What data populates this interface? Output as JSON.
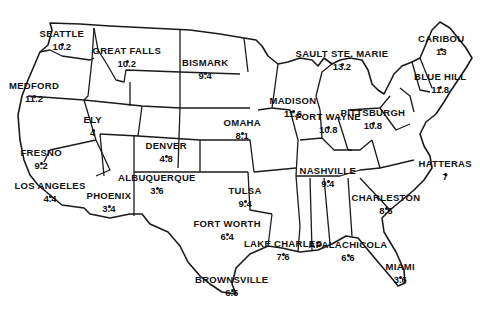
{
  "map": {
    "region": "United States (contiguous)",
    "style": "black outline state map on white",
    "colors": {
      "background": "#ffffff",
      "ink": "#111111"
    },
    "cities": [
      {
        "name": "SEATTLE",
        "value": "10.2",
        "x": 62,
        "y": 33
      },
      {
        "name": "GREAT FALLS",
        "value": "10.2",
        "x": 127,
        "y": 50
      },
      {
        "name": "BISMARK",
        "value": "9.4",
        "x": 205,
        "y": 62
      },
      {
        "name": "SAULT STE. MARIE",
        "value": "13.2",
        "x": 342,
        "y": 53
      },
      {
        "name": "CARIBOU",
        "value": "13",
        "x": 441,
        "y": 38
      },
      {
        "name": "BLUE HILL",
        "value": "11.8",
        "x": 440,
        "y": 76
      },
      {
        "name": "MEDFORD",
        "value": "11.2",
        "x": 34,
        "y": 85
      },
      {
        "name": "MADISON",
        "value": "11.6",
        "x": 293,
        "y": 100
      },
      {
        "name": "FORT WAYNE",
        "value": "10.8",
        "x": 328,
        "y": 116
      },
      {
        "name": "PITTSBURGH",
        "value": "10.8",
        "x": 373,
        "y": 112
      },
      {
        "name": "ELY",
        "value": "4",
        "x": 93,
        "y": 119
      },
      {
        "name": "OMAHA",
        "value": "8.1",
        "x": 242,
        "y": 122
      },
      {
        "name": "DENVER",
        "value": "4.8",
        "x": 166,
        "y": 145
      },
      {
        "name": "FRESNO",
        "value": "9.2",
        "x": 41,
        "y": 152
      },
      {
        "name": "HATTERAS",
        "value": "7",
        "x": 445,
        "y": 163
      },
      {
        "name": "NASHVILLE",
        "value": "9.4",
        "x": 328,
        "y": 170
      },
      {
        "name": "ALBUQUERQUE",
        "value": "3.6",
        "x": 157,
        "y": 177
      },
      {
        "name": "LOS ANGELES",
        "value": "4.4",
        "x": 50,
        "y": 185
      },
      {
        "name": "TULSA",
        "value": "9.4",
        "x": 245,
        "y": 190
      },
      {
        "name": "PHOENIX",
        "value": "3.4",
        "x": 109,
        "y": 195
      },
      {
        "name": "CHARLESTON",
        "value": "8.6",
        "x": 386,
        "y": 197
      },
      {
        "name": "FORT WORTH",
        "value": "6.4",
        "x": 227,
        "y": 223
      },
      {
        "name": "LAKE CHARLES",
        "value": "7.6",
        "x": 283,
        "y": 243
      },
      {
        "name": "APALACHICOLA",
        "value": "6.6",
        "x": 348,
        "y": 244
      },
      {
        "name": "MIAMI",
        "value": "3.6",
        "x": 400,
        "y": 266
      },
      {
        "name": "BROWNSVILLE",
        "value": "6.6",
        "x": 232,
        "y": 279
      }
    ]
  }
}
